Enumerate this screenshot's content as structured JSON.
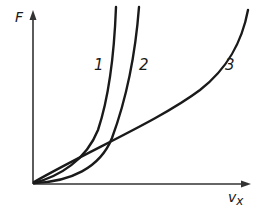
{
  "diagram": {
    "type": "force-velocity curves",
    "axes": {
      "y_label": "F",
      "x_label_main": "v",
      "x_label_sub": "x"
    },
    "curves": [
      {
        "id": "1",
        "label": "1",
        "shape": "steep exponential"
      },
      {
        "id": "2",
        "label": "2",
        "shape": "exponential, shifted right"
      },
      {
        "id": "3",
        "label": "3",
        "shape": "near-linear then rising"
      }
    ],
    "colors": {
      "line": "#1a1a1a",
      "axis": "#333333",
      "background": "#ffffff"
    }
  }
}
